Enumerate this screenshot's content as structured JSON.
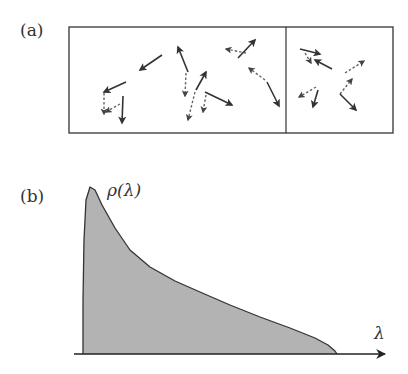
{
  "panel_a": {
    "label": "(a)",
    "box": {
      "x": 69,
      "y": 27,
      "width": 324,
      "height": 106,
      "divider_x": 286
    },
    "solid_arrows": [
      [
        162,
        55,
        140,
        70
      ],
      [
        188,
        72,
        178,
        47
      ],
      [
        126,
        82,
        104,
        92
      ],
      [
        196,
        90,
        206,
        72
      ],
      [
        238,
        58,
        255,
        40
      ],
      [
        205,
        92,
        232,
        105
      ],
      [
        267,
        82,
        279,
        106
      ],
      [
        123,
        96,
        122,
        123
      ],
      [
        300,
        49,
        320,
        54
      ],
      [
        332,
        69,
        315,
        60
      ],
      [
        318,
        90,
        313,
        107
      ],
      [
        340,
        94,
        356,
        110
      ]
    ],
    "dashed_arrows": [
      [
        104,
        93,
        104,
        114
      ],
      [
        120,
        104,
        106,
        112
      ],
      [
        186,
        73,
        185,
        96
      ],
      [
        195,
        92,
        188,
        120
      ],
      [
        206,
        95,
        203,
        112
      ],
      [
        246,
        53,
        226,
        49
      ],
      [
        265,
        80,
        249,
        68
      ],
      [
        305,
        53,
        311,
        63
      ],
      [
        316,
        87,
        299,
        97
      ],
      [
        340,
        94,
        352,
        79
      ],
      [
        345,
        73,
        364,
        61
      ]
    ]
  },
  "panel_b": {
    "label": "(b)",
    "curve_label": "ρ(λ)",
    "axis_label": "λ",
    "axis": {
      "x1": 74,
      "x2": 385,
      "y": 354
    },
    "curve_points": [
      [
        83,
        354
      ],
      [
        83,
        300
      ],
      [
        84,
        240
      ],
      [
        86,
        200
      ],
      [
        90,
        187
      ],
      [
        95,
        190
      ],
      [
        102,
        205
      ],
      [
        115,
        228
      ],
      [
        130,
        250
      ],
      [
        150,
        267
      ],
      [
        175,
        281
      ],
      [
        200,
        292
      ],
      [
        230,
        305
      ],
      [
        260,
        317
      ],
      [
        290,
        328
      ],
      [
        315,
        338
      ],
      [
        328,
        345
      ],
      [
        335,
        351
      ],
      [
        337,
        354
      ]
    ],
    "fill_color": "#b3b3b3",
    "stroke_color": "#333333"
  }
}
